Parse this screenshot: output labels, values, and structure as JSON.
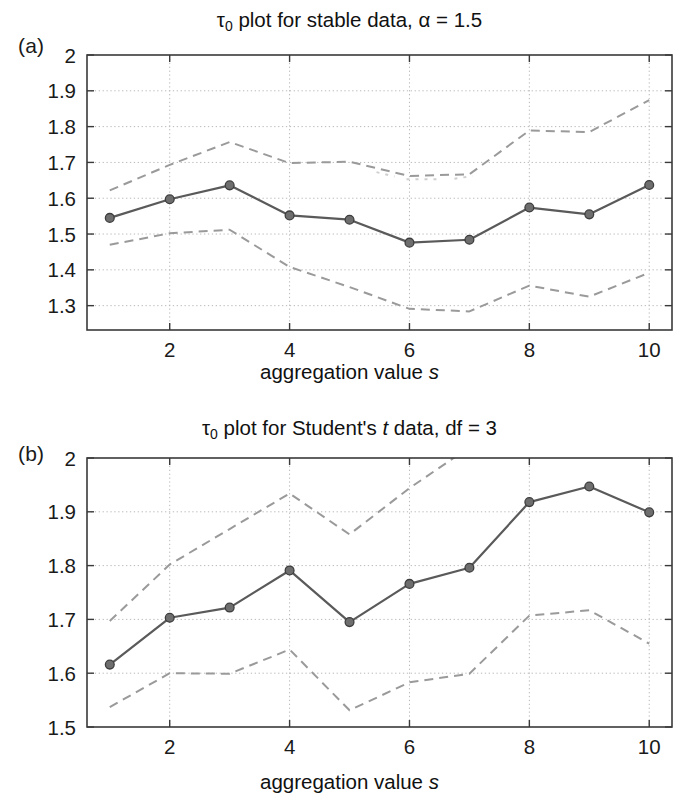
{
  "figure": {
    "background_color": "#ffffff",
    "line_color": "#5a5a5a",
    "band_color": "#9a9a9a",
    "grid_color": "#b9b9b9",
    "axis_color": "#3a3a3a"
  },
  "panels": [
    {
      "tag": "(a)",
      "title_prefix": "τ",
      "title_sub": "0",
      "title_rest": " plot for stable data, α = 1.5",
      "xlabel_text": "aggregation value ",
      "xlabel_ital": "s"
    },
    {
      "tag": "(b)",
      "title_prefix": "τ",
      "title_sub": "0",
      "title_rest_a": " plot for Student's ",
      "title_ital": "t",
      "title_rest_b": " data, df = 3",
      "xlabel_text": "aggregation value ",
      "xlabel_ital": "s"
    }
  ],
  "chart_data": [
    {
      "type": "line",
      "panel": "(a)",
      "title": "τ0 plot for stable data, α = 1.5",
      "xlabel": "aggregation value s",
      "ylabel": "",
      "grid": true,
      "legend": "none",
      "xlim": [
        0.62,
        10.38
      ],
      "ylim": [
        1.232,
        2.0
      ],
      "xticks": [
        2,
        4,
        6,
        8,
        10
      ],
      "xtick_labels": [
        "2",
        "4",
        "6",
        "8",
        "10"
      ],
      "yticks": [
        1.3,
        1.4,
        1.5,
        1.6,
        1.7,
        1.8,
        1.9,
        2.0
      ],
      "ytick_labels": [
        "1.3",
        "1.4",
        "1.5",
        "1.6",
        "1.7",
        "1.8",
        "1.9",
        "2"
      ],
      "x": [
        1,
        2,
        3,
        4,
        5,
        6,
        7,
        8,
        9,
        10
      ],
      "series": [
        {
          "name": "tau0 estimate",
          "style": "solid-markers",
          "values": [
            1.545,
            1.597,
            1.636,
            1.552,
            1.54,
            1.476,
            1.484,
            1.574,
            1.555,
            1.637
          ]
        },
        {
          "name": "upper confidence band",
          "style": "dashed",
          "values": [
            1.622,
            1.693,
            1.757,
            1.698,
            1.702,
            1.662,
            1.667,
            1.789,
            1.785,
            1.874
          ]
        },
        {
          "name": "lower confidence band",
          "style": "dashed",
          "values": [
            1.47,
            1.502,
            1.512,
            1.408,
            1.352,
            1.291,
            1.284,
            1.356,
            1.325,
            1.392
          ]
        }
      ]
    },
    {
      "type": "line",
      "panel": "(b)",
      "title": "τ0 plot for Student's t data, df = 3",
      "xlabel": "aggregation value s",
      "ylabel": "",
      "grid": true,
      "legend": "none",
      "xlim": [
        0.62,
        10.38
      ],
      "ylim": [
        1.5,
        2.0
      ],
      "xticks": [
        2,
        4,
        6,
        8,
        10
      ],
      "xtick_labels": [
        "2",
        "4",
        "6",
        "8",
        "10"
      ],
      "yticks": [
        1.5,
        1.6,
        1.7,
        1.8,
        1.9,
        2.0
      ],
      "ytick_labels": [
        "1.5",
        "1.6",
        "1.7",
        "1.8",
        "1.9",
        "2"
      ],
      "x": [
        1,
        2,
        3,
        4,
        5,
        6,
        7,
        8,
        9,
        10
      ],
      "series": [
        {
          "name": "tau0 estimate",
          "style": "solid-markers",
          "values": [
            1.616,
            1.703,
            1.722,
            1.791,
            1.695,
            1.766,
            1.796,
            1.918,
            1.947,
            1.899
          ]
        },
        {
          "name": "upper confidence band",
          "style": "dashed",
          "values": [
            1.697,
            1.802,
            1.868,
            1.934,
            1.858,
            1.944,
            2.02,
            2.08,
            2.12,
            2.06
          ]
        },
        {
          "name": "lower confidence band",
          "style": "dashed",
          "values": [
            1.537,
            1.6,
            1.599,
            1.644,
            1.531,
            1.583,
            1.599,
            1.707,
            1.717,
            1.655
          ]
        }
      ]
    }
  ]
}
